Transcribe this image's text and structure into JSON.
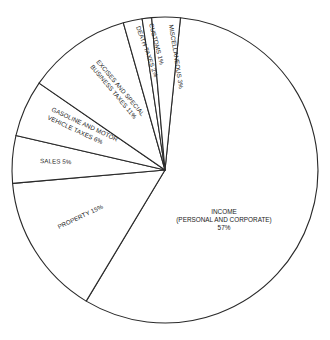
{
  "chart_data": {
    "type": "pie",
    "title": "",
    "start_angle_deg_clockwise_from_top": 5.8,
    "direction": "clockwise",
    "slices": [
      {
        "label": "INCOME (PERSONAL AND CORPORATE)",
        "value": 57
      },
      {
        "label": "PROPERTY",
        "value": 15
      },
      {
        "label": "SALES",
        "value": 5
      },
      {
        "label": "GASOLINE AND MOTOR VEHICLE TAXES",
        "value": 6
      },
      {
        "label": "EXCISES AND SPECIAL BUSINESS TAXES",
        "value": 11
      },
      {
        "label": "DEATH TAXES",
        "value": 2
      },
      {
        "label": "CUSTOMS",
        "value": 1
      },
      {
        "label": "MISCELLANEOUS",
        "value": 3
      }
    ],
    "legend": "none",
    "fill": "white with black outlines"
  },
  "labels": {
    "income_l1": "INCOME",
    "income_l2": "(PERSONAL AND CORPORATE)",
    "income_l3": "57%",
    "property": "PROPERTY 15%",
    "sales": "SALES 5%",
    "gasoline_l1": "GASOLINE AND MOTOR",
    "gasoline_l2": "VEHICLE TAXES 6%",
    "excises_l1": "EXCISES AND SPECIAL",
    "excises_l2": "BUSINESS TAXES 11%",
    "death": "DEATH TAXES 2%",
    "customs": "CUSTOMS 1%",
    "misc": "MISCELLANEOUS 3%"
  },
  "colors": {
    "stroke": "#2a2a2a",
    "fill": "#ffffff",
    "text": "#1a1a1a"
  }
}
